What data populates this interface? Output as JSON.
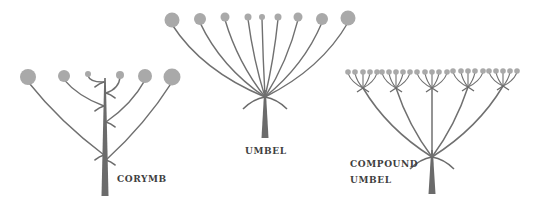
{
  "figure": {
    "colors": {
      "stem": "#6b6b6b",
      "pedicel": "#707070",
      "flower": "#a9a9a9",
      "label": "#3f3f3f",
      "background": "#ffffff"
    }
  },
  "diagrams": [
    {
      "id": "corymb",
      "label_lines": [
        "CORYMB"
      ],
      "label_pos": [
        117,
        173
      ],
      "stem": {
        "x": 105,
        "top": 78,
        "bottom": 196,
        "width_bottom": 7
      },
      "flowers": [
        {
          "x": 28,
          "y": 77,
          "r": 8,
          "attach_y": 155
        },
        {
          "x": 64,
          "y": 76,
          "r": 6,
          "attach_y": 106
        },
        {
          "x": 88,
          "y": 74,
          "r": 3,
          "attach_y": 82
        },
        {
          "x": 120,
          "y": 75,
          "r": 4,
          "attach_y": 93
        },
        {
          "x": 145,
          "y": 76,
          "r": 7,
          "attach_y": 122
        },
        {
          "x": 172,
          "y": 77,
          "r": 8.5,
          "attach_y": 160
        }
      ]
    },
    {
      "id": "umbel",
      "label_lines": [
        "UMBEL"
      ],
      "label_pos": [
        245,
        145
      ],
      "stem": {
        "x": 265,
        "top": 90,
        "bottom": 138,
        "width_bottom": 7
      },
      "node_y": 97,
      "flowers": [
        {
          "x": 172,
          "y": 20,
          "r": 7.5
        },
        {
          "x": 200,
          "y": 19,
          "r": 6
        },
        {
          "x": 225,
          "y": 17,
          "r": 4.5
        },
        {
          "x": 248,
          "y": 17,
          "r": 3.5
        },
        {
          "x": 262,
          "y": 17,
          "r": 3
        },
        {
          "x": 278,
          "y": 17,
          "r": 3.5
        },
        {
          "x": 298,
          "y": 17,
          "r": 4.5
        },
        {
          "x": 322,
          "y": 19,
          "r": 6
        },
        {
          "x": 348,
          "y": 18,
          "r": 7.5
        }
      ]
    },
    {
      "id": "compound-umbel",
      "label_lines": [
        "COMPOUND",
        "UMBEL"
      ],
      "label_pos": [
        350,
        158
      ],
      "stem": {
        "x": 432,
        "top": 150,
        "bottom": 194,
        "width_bottom": 7
      },
      "node_y": 157,
      "umbellets": [
        {
          "node_x": 363,
          "node_y": 88,
          "flower_xs": [
            348,
            355,
            363,
            370,
            377
          ],
          "flower_y": 72,
          "r": 2.8
        },
        {
          "node_x": 396,
          "node_y": 88,
          "flower_xs": [
            382,
            389,
            396,
            403,
            410
          ],
          "flower_y": 72,
          "r": 2.8
        },
        {
          "node_x": 432,
          "node_y": 88,
          "flower_xs": [
            417,
            425,
            432,
            439,
            447
          ],
          "flower_y": 72,
          "r": 2.8
        },
        {
          "node_x": 468,
          "node_y": 87,
          "flower_xs": [
            453,
            461,
            468,
            475,
            483
          ],
          "flower_y": 71,
          "r": 2.8
        },
        {
          "node_x": 503,
          "node_y": 86,
          "flower_xs": [
            489,
            496,
            503,
            510,
            517
          ],
          "flower_y": 71,
          "r": 2.8
        }
      ]
    }
  ]
}
